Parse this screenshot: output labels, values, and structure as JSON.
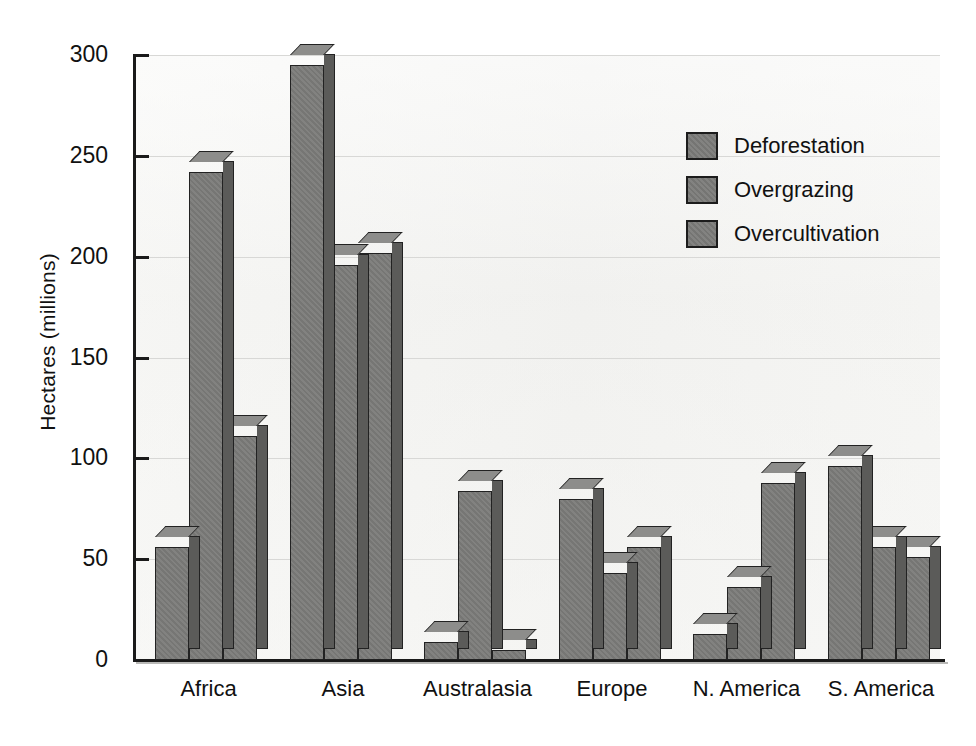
{
  "chart_data": {
    "type": "bar",
    "title": "",
    "subtitle": "",
    "xlabel": "",
    "ylabel": "Hectares (millions)",
    "categories": [
      "Africa",
      "Asia",
      "Australasia",
      "Europe",
      "N. America",
      "S. America"
    ],
    "series": [
      {
        "name": "Deforestation",
        "values": [
          56,
          295,
          9,
          80,
          13,
          96
        ]
      },
      {
        "name": "Overgrazing",
        "values": [
          242,
          196,
          84,
          43,
          36,
          56
        ]
      },
      {
        "name": "Overcultivation",
        "values": [
          111,
          202,
          5,
          56,
          88,
          51
        ]
      }
    ],
    "ylim": [
      0,
      300
    ],
    "yticks": [
      0,
      50,
      100,
      150,
      200,
      250,
      300
    ],
    "ytick_labels": [
      "0",
      "50",
      "100",
      "150",
      "200",
      "250",
      "300"
    ],
    "grid": true,
    "grid_axis": "y",
    "legend_position": "upper right",
    "bar_style": "3d",
    "colors": {
      "bar_face": "#7b7b79",
      "bar_side": "#5b5b59",
      "bar_top": "#8d8d8b",
      "bar_outline": "#222222",
      "plot_background": "#f2f2f0",
      "gridline": "#d8d8d6",
      "axis": "#1a1a1a",
      "text": "#111111",
      "page_background": "#ffffff"
    }
  },
  "axis": {
    "y_label": "Hectares (millions)",
    "y_ticks": [
      "300",
      "250",
      "200",
      "150",
      "100",
      "50",
      "0"
    ]
  },
  "legend": {
    "items": [
      {
        "label": "Deforestation"
      },
      {
        "label": "Overgrazing"
      },
      {
        "label": "Overcultivation"
      }
    ]
  },
  "x_categories": [
    {
      "label": "Africa"
    },
    {
      "label": "Asia"
    },
    {
      "label": "Australasia"
    },
    {
      "label": "Europe"
    },
    {
      "label": "N. America"
    },
    {
      "label": "S. America"
    }
  ]
}
